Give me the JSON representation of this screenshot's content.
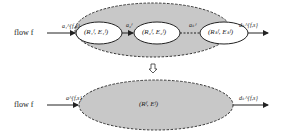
{
  "top": {
    "flow_label": "flow f",
    "in_edge": "a₁^{f,s}",
    "nodes": [
      {
        "label": "(R₁ᶠ, E₁ᶠ)"
      },
      {
        "label": "(R₂ᶠ, E₂ᶠ)"
      },
      {
        "label": "(Rₖᶠ, Eₖᶠ)"
      }
    ],
    "edges": [
      {
        "label": "a₂ᶠ"
      },
      {
        "label": "aₖᶠ"
      }
    ],
    "out_edge": "dₖ^{f,s}"
  },
  "transform_arrow": "⇩",
  "bottom": {
    "flow_label": "flow f",
    "in_edge": "a^{f,s}",
    "node": {
      "label": "(Rᶠ, Eᶠ)"
    },
    "out_edge": "dₖ^{f,s}"
  },
  "colors": {
    "fill": "#c8c8c8",
    "node_fill": "#ffffff",
    "stroke": "#333333"
  }
}
